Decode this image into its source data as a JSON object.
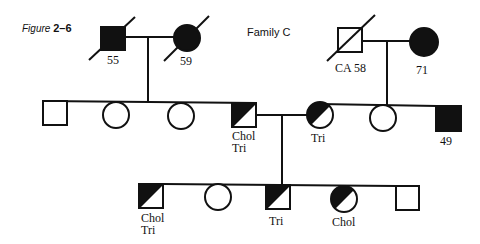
{
  "figure": {
    "label_prefix": "Figure",
    "label_number": "2–6"
  },
  "title": "Family C",
  "generation1": {
    "left_couple": {
      "male": {
        "status": "affected",
        "deceased": true,
        "label": "55"
      },
      "female": {
        "status": "affected",
        "deceased": true,
        "label": "59"
      }
    },
    "right_couple": {
      "male": {
        "status": "unaffected",
        "deceased": true,
        "label": "CA 58"
      },
      "female": {
        "status": "affected",
        "deceased": false,
        "label": "71"
      }
    }
  },
  "generation2": [
    {
      "sex": "male",
      "status": "unaffected",
      "label": ""
    },
    {
      "sex": "female",
      "status": "unaffected",
      "label": ""
    },
    {
      "sex": "female",
      "status": "unaffected",
      "label": ""
    },
    {
      "sex": "male",
      "status": "half-affected",
      "label_line1": "Chol",
      "label_line2": "Tri"
    },
    {
      "sex": "female",
      "status": "half-affected",
      "label": "Tri"
    },
    {
      "sex": "female",
      "status": "unaffected",
      "label": ""
    },
    {
      "sex": "male",
      "status": "affected",
      "label": "49"
    }
  ],
  "generation3": [
    {
      "sex": "male",
      "status": "half-affected",
      "label_line1": "Chol",
      "label_line2": "Tri"
    },
    {
      "sex": "female",
      "status": "unaffected",
      "label": ""
    },
    {
      "sex": "male",
      "status": "half-affected",
      "label": "Tri"
    },
    {
      "sex": "female",
      "status": "half-affected",
      "label": "Chol"
    },
    {
      "sex": "male",
      "status": "unaffected",
      "label": ""
    }
  ]
}
